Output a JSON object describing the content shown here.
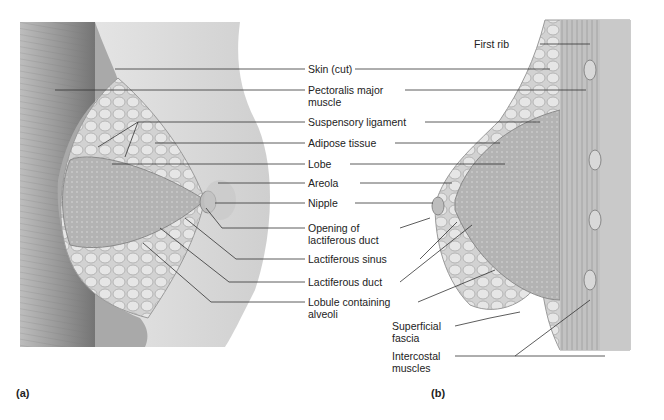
{
  "figure": {
    "panels": [
      {
        "id": "a",
        "label": "(a)"
      },
      {
        "id": "b",
        "label": "(b)"
      }
    ],
    "labels": [
      {
        "key": "first_rib",
        "text": "First rib"
      },
      {
        "key": "skin",
        "text": "Skin (cut)"
      },
      {
        "key": "pectoralis_1",
        "text": "Pectoralis major"
      },
      {
        "key": "pectoralis_2",
        "text": "muscle"
      },
      {
        "key": "suspensory",
        "text": "Suspensory ligament"
      },
      {
        "key": "adipose",
        "text": "Adipose tissue"
      },
      {
        "key": "lobe",
        "text": "Lobe"
      },
      {
        "key": "areola",
        "text": "Areola"
      },
      {
        "key": "nipple",
        "text": "Nipple"
      },
      {
        "key": "opening_1",
        "text": "Opening of"
      },
      {
        "key": "opening_2",
        "text": "lactiferous duct"
      },
      {
        "key": "sinus",
        "text": "Lactiferous sinus"
      },
      {
        "key": "duct",
        "text": "Lactiferous duct"
      },
      {
        "key": "lobule_1",
        "text": "Lobule containing"
      },
      {
        "key": "lobule_2",
        "text": "alveoli"
      },
      {
        "key": "fascia_1",
        "text": "Superficial"
      },
      {
        "key": "fascia_2",
        "text": "fascia"
      },
      {
        "key": "intercostal_1",
        "text": "Intercostal"
      },
      {
        "key": "intercostal_2",
        "text": "muscles"
      }
    ]
  }
}
